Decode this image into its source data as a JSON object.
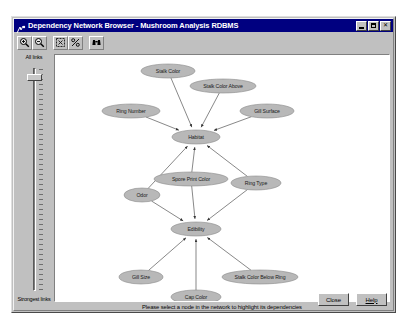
{
  "window": {
    "title": "Dependency Network Browser - Mushroom Analysis RDBMS",
    "icon": "network-browser-icon",
    "controls": {
      "minimize": "minimize-button",
      "maximize": "maximize-button",
      "close_glyph": "✕"
    }
  },
  "toolbar": {
    "buttons": [
      {
        "name": "zoom-in-icon",
        "tooltip": "Zoom In"
      },
      {
        "name": "zoom-out-icon",
        "tooltip": "Zoom Out"
      },
      {
        "name": "zoom-fit-icon",
        "tooltip": "Zoom to Fit"
      },
      {
        "name": "zoom-percent-icon",
        "tooltip": "Zoom Percent"
      },
      {
        "name": "find-binoculars-icon",
        "tooltip": "Find"
      }
    ]
  },
  "slider": {
    "name": "link-strength-slider",
    "top_label": "All links",
    "bottom_label": "Strongest links",
    "value_position_percent": 4
  },
  "status": {
    "message": "Please select a node in the network to highlight its dependencies"
  },
  "footer": {
    "close_label": "Close",
    "help_label": "Help"
  },
  "chart_data": {
    "type": "diagram",
    "title": "Dependency Network",
    "layout": "hierarchical-directed-graph",
    "nodes": [
      {
        "id": "stalk_color",
        "label": "Stalk Color",
        "x": 113,
        "y": 16,
        "rx": 27,
        "ry": 7
      },
      {
        "id": "stalk_color_above",
        "label": "Stalk Color Above",
        "x": 168,
        "y": 31,
        "rx": 33,
        "ry": 7
      },
      {
        "id": "ring_number",
        "label": "Ring Number",
        "x": 76,
        "y": 56,
        "rx": 29,
        "ry": 7
      },
      {
        "id": "gill_surface",
        "label": "Gill Surface",
        "x": 212,
        "y": 56,
        "rx": 27,
        "ry": 7
      },
      {
        "id": "habitat",
        "label": "Habitat",
        "x": 141,
        "y": 82,
        "rx": 24,
        "ry": 7
      },
      {
        "id": "spore_print_color",
        "label": "Spore Print Color",
        "x": 136,
        "y": 124,
        "rx": 37,
        "ry": 7
      },
      {
        "id": "ring_type",
        "label": "Ring Type",
        "x": 201,
        "y": 128,
        "rx": 25,
        "ry": 7
      },
      {
        "id": "odor",
        "label": "Odor",
        "x": 87,
        "y": 140,
        "rx": 18,
        "ry": 7
      },
      {
        "id": "edibility",
        "label": "Edibility",
        "x": 141,
        "y": 174,
        "rx": 25,
        "ry": 7
      },
      {
        "id": "gill_size",
        "label": "Gill Size",
        "x": 86,
        "y": 222,
        "rx": 22,
        "ry": 7
      },
      {
        "id": "stalk_color_below",
        "label": "Stalk Color Below Ring",
        "x": 205,
        "y": 222,
        "rx": 38,
        "ry": 7
      },
      {
        "id": "cap_color",
        "label": "Cap Color",
        "x": 141,
        "y": 242,
        "rx": 25,
        "ry": 7
      }
    ],
    "edges": [
      {
        "from": "stalk_color",
        "to": "habitat",
        "arrow": true
      },
      {
        "from": "stalk_color_above",
        "to": "habitat",
        "arrow": true
      },
      {
        "from": "ring_number",
        "to": "habitat",
        "arrow": true
      },
      {
        "from": "gill_surface",
        "to": "habitat",
        "arrow": true
      },
      {
        "from": "spore_print_color",
        "to": "habitat",
        "arrow": true
      },
      {
        "from": "ring_type",
        "to": "habitat",
        "arrow": true
      },
      {
        "from": "odor",
        "to": "habitat",
        "arrow": true
      },
      {
        "from": "spore_print_color",
        "to": "edibility",
        "arrow": true
      },
      {
        "from": "ring_type",
        "to": "edibility",
        "arrow": true
      },
      {
        "from": "odor",
        "to": "edibility",
        "arrow": true
      },
      {
        "from": "gill_size",
        "to": "edibility",
        "arrow": true
      },
      {
        "from": "stalk_color_below",
        "to": "edibility",
        "arrow": true
      },
      {
        "from": "cap_color",
        "to": "edibility",
        "arrow": true
      }
    ]
  }
}
